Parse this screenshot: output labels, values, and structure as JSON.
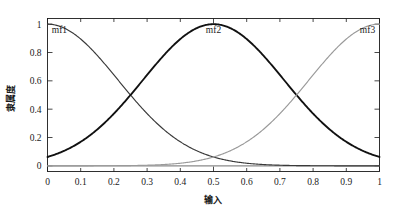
{
  "chart_data": {
    "type": "line",
    "title": "",
    "subtitle": "",
    "xlabel": "输入",
    "ylabel": "隶属度",
    "xlim": [
      0,
      1
    ],
    "ylim": [
      -0.04,
      1.04
    ],
    "grid": false,
    "legend_position": "inside-top-annotations",
    "x_ticks": [
      0,
      0.1,
      0.2,
      0.3,
      0.4,
      0.5,
      0.6,
      0.7,
      0.8,
      0.9,
      1
    ],
    "x_tick_labels": [
      "0",
      "0.1",
      "0.2",
      "0.3",
      "0.4",
      "0.5",
      "0.6",
      "0.7",
      "0.8",
      "0.9",
      "1"
    ],
    "y_ticks": [
      0,
      0.2,
      0.4,
      0.6,
      0.8,
      1
    ],
    "y_tick_labels": [
      "0",
      "0.2",
      "0.4",
      "0.6",
      "0.8",
      "1"
    ],
    "annotations": [
      {
        "text": "mf1",
        "x": 0.01,
        "y": 1.0,
        "anchor": "start"
      },
      {
        "text": "mf2",
        "x": 0.5,
        "y": 1.0,
        "anchor": "middle"
      },
      {
        "text": "mf3",
        "x": 0.99,
        "y": 1.0,
        "anchor": "end"
      }
    ],
    "series": [
      {
        "name": "mf1",
        "kind": "gaussian",
        "center": 0.0,
        "sigma": 0.2123,
        "peak": 1.0,
        "color": "#3a3a3a",
        "width": 1.15,
        "x": [
          0,
          0.05,
          0.1,
          0.15,
          0.2,
          0.25,
          0.3,
          0.35,
          0.4,
          0.45,
          0.5,
          0.55,
          0.6,
          0.65,
          0.7,
          0.75,
          0.8,
          0.85,
          0.9,
          0.95,
          1
        ],
        "values": [
          1.0,
          0.9727,
          0.8948,
          0.7807,
          0.6493,
          0.5184,
          0.3985,
          0.2945,
          0.2096,
          0.1434,
          0.0944,
          0.0598,
          0.0364,
          0.0213,
          0.012,
          0.0065,
          0.0034,
          0.0017,
          0.0008,
          0.0004,
          0.0002
        ]
      },
      {
        "name": "mf2",
        "kind": "gaussian",
        "center": 0.5,
        "sigma": 0.2123,
        "peak": 1.0,
        "color": "#111111",
        "width": 1.85,
        "x": [
          0,
          0.05,
          0.1,
          0.15,
          0.2,
          0.25,
          0.3,
          0.35,
          0.4,
          0.45,
          0.5,
          0.55,
          0.6,
          0.65,
          0.7,
          0.75,
          0.8,
          0.85,
          0.9,
          0.95,
          1
        ],
        "values": [
          0.0944,
          0.1434,
          0.2096,
          0.2945,
          0.3985,
          0.5184,
          0.6493,
          0.7807,
          0.8948,
          0.9727,
          1.0,
          0.9727,
          0.8948,
          0.7807,
          0.6493,
          0.5184,
          0.3985,
          0.2945,
          0.2096,
          0.1434,
          0.0944
        ]
      },
      {
        "name": "mf3",
        "kind": "gaussian",
        "center": 1.0,
        "sigma": 0.2123,
        "peak": 1.0,
        "color": "#9a9a9a",
        "width": 1.15,
        "x": [
          0,
          0.05,
          0.1,
          0.15,
          0.2,
          0.25,
          0.3,
          0.35,
          0.4,
          0.45,
          0.5,
          0.55,
          0.6,
          0.65,
          0.7,
          0.75,
          0.8,
          0.85,
          0.9,
          0.95,
          1
        ],
        "values": [
          0.0002,
          0.0004,
          0.0008,
          0.0017,
          0.0034,
          0.0065,
          0.012,
          0.0213,
          0.0364,
          0.0598,
          0.0944,
          0.1434,
          0.2096,
          0.2945,
          0.3985,
          0.5184,
          0.6493,
          0.7807,
          0.8948,
          0.9727,
          1.0
        ]
      }
    ],
    "baseline": {
      "y": 0,
      "color": "#8a8a8a"
    },
    "crossings": [
      {
        "x": 0.25,
        "y": 0.5184,
        "between": [
          "mf1",
          "mf2"
        ]
      },
      {
        "x": 0.75,
        "y": 0.5184,
        "between": [
          "mf2",
          "mf3"
        ]
      }
    ]
  }
}
